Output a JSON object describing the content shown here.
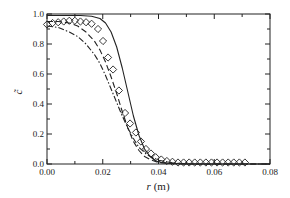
{
  "chart_data": {
    "type": "line",
    "title": "",
    "xlabel": "r (m)",
    "xlabel_parts": {
      "var": "r",
      "unit": "(m)"
    },
    "ylabel": "c̃",
    "xlim": [
      0.0,
      0.08
    ],
    "ylim": [
      0.0,
      1.0
    ],
    "grid": false,
    "legend": null,
    "x_ticks": [
      0.0,
      0.02,
      0.04,
      0.06,
      0.08
    ],
    "x_tick_labels": [
      "0.00",
      "0.02",
      "0.04",
      "0.06",
      "0.08"
    ],
    "x_minor_ticks": [
      0.01,
      0.03,
      0.05,
      0.07
    ],
    "y_ticks": [
      0.0,
      0.2,
      0.4,
      0.6,
      0.8,
      1.0
    ],
    "y_tick_labels": [
      "0.0",
      "0.2",
      "0.4",
      "0.6",
      "0.8",
      "1.0"
    ],
    "y_minor_ticks": [
      0.1,
      0.3,
      0.5,
      0.7,
      0.9
    ],
    "series": [
      {
        "name": "solid",
        "style": "solid",
        "x": [
          0.0,
          0.004,
          0.008,
          0.012,
          0.016,
          0.019,
          0.021,
          0.023,
          0.025,
          0.027,
          0.029,
          0.031,
          0.033,
          0.035,
          0.037,
          0.039,
          0.041,
          0.044,
          0.048,
          0.055,
          0.08
        ],
        "y": [
          0.99,
          0.99,
          0.99,
          0.99,
          0.985,
          0.97,
          0.94,
          0.88,
          0.78,
          0.64,
          0.48,
          0.32,
          0.19,
          0.1,
          0.05,
          0.02,
          0.01,
          0.004,
          0.002,
          0.0,
          0.0
        ]
      },
      {
        "name": "dashed",
        "style": "dashed",
        "x": [
          0.0,
          0.004,
          0.008,
          0.011,
          0.014,
          0.017,
          0.019,
          0.021,
          0.023,
          0.025,
          0.027,
          0.029,
          0.031,
          0.033,
          0.035,
          0.037,
          0.04,
          0.044,
          0.05,
          0.08
        ],
        "y": [
          0.95,
          0.95,
          0.94,
          0.92,
          0.88,
          0.82,
          0.76,
          0.68,
          0.58,
          0.47,
          0.35,
          0.24,
          0.15,
          0.09,
          0.05,
          0.03,
          0.01,
          0.004,
          0.0,
          0.0
        ]
      },
      {
        "name": "dash-dot",
        "style": "dashdot",
        "x": [
          0.0,
          0.004,
          0.008,
          0.011,
          0.014,
          0.017,
          0.019,
          0.021,
          0.023,
          0.025,
          0.027,
          0.029,
          0.031,
          0.033,
          0.036,
          0.04,
          0.045,
          0.05,
          0.08
        ],
        "y": [
          0.92,
          0.91,
          0.88,
          0.85,
          0.8,
          0.73,
          0.67,
          0.59,
          0.5,
          0.41,
          0.32,
          0.24,
          0.17,
          0.11,
          0.06,
          0.025,
          0.008,
          0.0,
          0.0
        ]
      },
      {
        "name": "diamonds",
        "style": "marker-diamond",
        "x": [
          0.0,
          0.002,
          0.004,
          0.006,
          0.008,
          0.01,
          0.012,
          0.014,
          0.016,
          0.0183,
          0.0201,
          0.0219,
          0.0237,
          0.0258,
          0.028,
          0.0298,
          0.0319,
          0.0337,
          0.0355,
          0.0373,
          0.039,
          0.041,
          0.043,
          0.045,
          0.047,
          0.049,
          0.051,
          0.053,
          0.055,
          0.057,
          0.059,
          0.061,
          0.063,
          0.065,
          0.067,
          0.069,
          0.071
        ],
        "y": [
          0.93,
          0.94,
          0.945,
          0.95,
          0.955,
          0.955,
          0.95,
          0.945,
          0.935,
          0.9,
          0.82,
          0.71,
          0.63,
          0.49,
          0.34,
          0.27,
          0.21,
          0.15,
          0.1,
          0.07,
          0.045,
          0.03,
          0.02,
          0.015,
          0.01,
          0.01,
          0.01,
          0.01,
          0.01,
          0.01,
          0.01,
          0.01,
          0.01,
          0.01,
          0.01,
          0.01,
          0.01
        ]
      }
    ]
  },
  "axes": {
    "xlabel_var": "r",
    "xlabel_unit": "(m)",
    "ylabel": "c̃"
  }
}
